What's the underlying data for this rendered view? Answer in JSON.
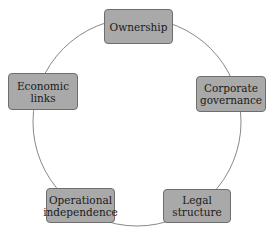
{
  "diagram": {
    "type": "cycle",
    "nodes": [
      {
        "id": "ownership",
        "label": "Ownership"
      },
      {
        "id": "corporate-governance",
        "label": "Corporate\ngovernance"
      },
      {
        "id": "legal-structure",
        "label": "Legal\nstructure"
      },
      {
        "id": "operational-independence",
        "label": "Operational\nindependence"
      },
      {
        "id": "economic-links",
        "label": "Economic\nlinks"
      }
    ],
    "colors": {
      "node_fill": "#a9a9a9",
      "node_border": "#6e6e6e",
      "ring": "#777777"
    }
  }
}
